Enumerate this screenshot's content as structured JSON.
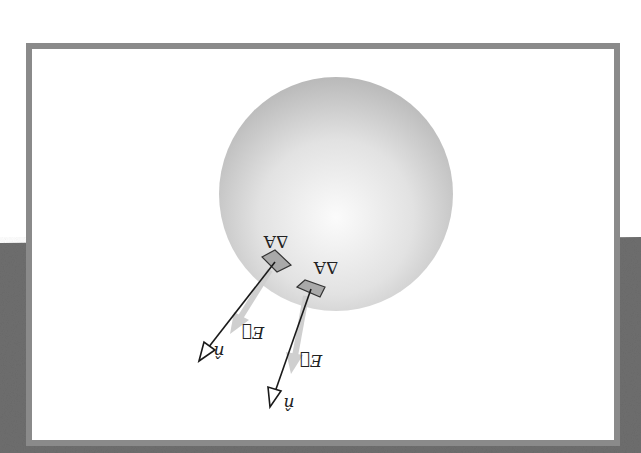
{
  "figure": {
    "orientation": "rotated 180 degrees",
    "colors": {
      "page_background": "#ffffff",
      "backdrop_dark": "#6e6e6e",
      "frame_border": "#8a8a8a",
      "frame_fill": "#ffffff",
      "sphere_light": "#fbfbfb",
      "sphere_dark": "#b9b9b9",
      "patch_fill": "#a9a9a9",
      "normal_vector": "#1a1a1a",
      "field_vector": "#c8c8c8"
    },
    "elements": [
      {
        "area_label": "ΔA",
        "normal_label": "n̂",
        "field_label": "E⃗"
      },
      {
        "area_label": "ΔA",
        "normal_label": "n̂",
        "field_label": "E⃗"
      }
    ]
  }
}
